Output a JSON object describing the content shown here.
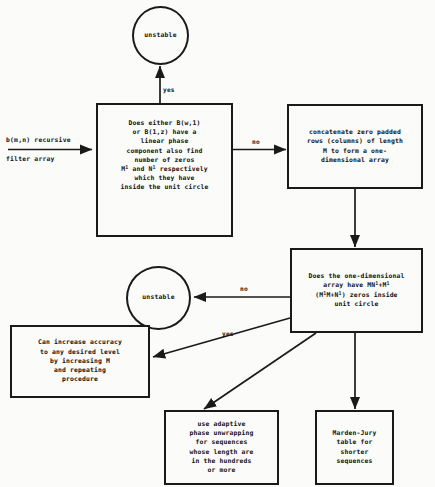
{
  "diagram": {
    "background_color": "#fbfbf9",
    "line_color": "#1a1a1a"
  },
  "io_labels": {
    "input_line1": "b(m,n) recursive",
    "input_line2": "filter array"
  },
  "nodes": {
    "unstable_top": {
      "label": "unstable",
      "shape": "circle"
    },
    "decision_linear_phase": {
      "label": "Does either B(w,1)\nor B(1,z) have a\nlinear phase\ncomponent also find\nnumber of zeros\nM¹ and N¹ respectively\nwhich they have\ninside the unit circle",
      "shape": "box"
    },
    "concatenate": {
      "label": "concatenate zero padded\nrows (columns) of length\nM to form a one-\ndimensional array",
      "shape": "box"
    },
    "decision_one_dimensional": {
      "label": "Does the one-dimensional\narray have MN¹+M¹\n(M¹M+N¹) zeros inside\nunit circle",
      "shape": "box"
    },
    "unstable_mid": {
      "label": "unstable",
      "shape": "circle"
    },
    "increase_accuracy": {
      "label": "Can increase accuracy\nto any desired level\nby increasing M\nand repeating\nprocedure",
      "shape": "box"
    },
    "adaptive_phase": {
      "label": "use adaptive\nphase unwrapping\nfor sequences\nwhose length are\nin the hundreds\nor more",
      "shape": "box"
    },
    "marden_jury": {
      "label": "Marden-Jury\ntable for\nshorter\nsequences",
      "shape": "box"
    }
  },
  "edge_labels": {
    "yes_top": "yes",
    "no_top": "no",
    "no_mid": "no",
    "yes_mid": "yes"
  }
}
